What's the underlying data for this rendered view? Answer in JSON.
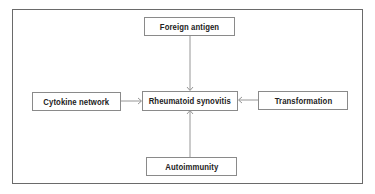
{
  "diagram": {
    "center": {
      "label": "Rheumatoid synovitis"
    },
    "nodes": {
      "top": {
        "label": "Foreign antigen"
      },
      "left": {
        "label": "Cytokine network"
      },
      "right": {
        "label": "Transformation"
      },
      "bottom": {
        "label": "Autoimmunity"
      }
    },
    "edges": [
      {
        "from": "Foreign antigen",
        "to": "Rheumatoid synovitis"
      },
      {
        "from": "Cytokine network",
        "to": "Rheumatoid synovitis"
      },
      {
        "from": "Transformation",
        "to": "Rheumatoid synovitis"
      },
      {
        "from": "Autoimmunity",
        "to": "Rheumatoid synovitis"
      }
    ],
    "colors": {
      "line": "#8a8a8a",
      "frame": "#6a6a6a",
      "text": "#222222"
    }
  }
}
